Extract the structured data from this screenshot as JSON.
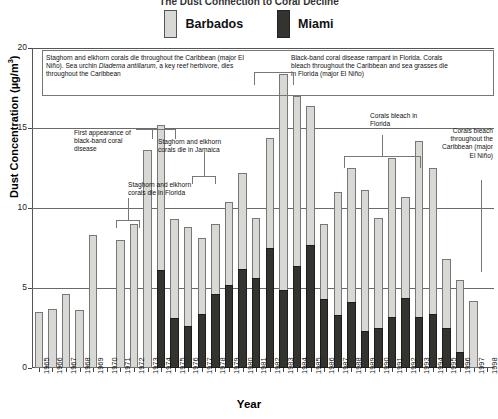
{
  "title": "The Dust Connection to Coral Decline",
  "legend": [
    {
      "label": "Barbados",
      "color": "#d8d8d4",
      "key": "barbados"
    },
    {
      "label": "Miami",
      "color": "#333330",
      "key": "miami"
    }
  ],
  "axes": {
    "y_title": "Dust Concentration (µg/m",
    "y_title_sup": "3",
    "y_title_close": ")",
    "x_title": "Year",
    "y_ticks": [
      "0",
      "5",
      "10",
      "15",
      "20"
    ]
  },
  "annotations": [
    {
      "id": "ann-1983-elnino",
      "text": "Staghorn and elkhorn corals die throughout the Caribbean (major El Niño). Sea urchin Diadema antillarum, a key reef herbivore, dies throughout the Caribbean"
    },
    {
      "id": "ann-blackband-rampant",
      "text": "Black-band coral disease rampant in Florida. Corals bleach throughout the Caribbean and sea grasses die in Florida (major El Niño)"
    },
    {
      "id": "ann-first-blackband",
      "text": "First appearance of black-band coral disease"
    },
    {
      "id": "ann-jamaica",
      "text": "Staghorn and elkhorn corals die in Jamaica"
    },
    {
      "id": "ann-florida-die",
      "text": "Staghorn and elkhorn corals die in Florida"
    },
    {
      "id": "ann-florida-bleach",
      "text": "Corals bleach in Florida"
    },
    {
      "id": "ann-1998-bleach",
      "text": "Corals bleach throughout the Caribbean (major El Niño)"
    }
  ],
  "chart_data": {
    "type": "bar",
    "title": "The Dust Connection to Coral Decline",
    "xlabel": "Year",
    "ylabel": "Dust Concentration (µg/m3)",
    "ylim": [
      0,
      20
    ],
    "yticks": [
      0,
      5,
      10,
      15,
      20
    ],
    "grid": true,
    "legend_position": "top-center",
    "categories": [
      "1965",
      "1966",
      "1967",
      "1968",
      "1969",
      "1970",
      "1971",
      "1972",
      "1973",
      "1974",
      "1975",
      "1976",
      "1977",
      "1978",
      "1979",
      "1980",
      "1981",
      "1982",
      "1983",
      "1984",
      "1985",
      "1986",
      "1987",
      "1988",
      "1989",
      "1990",
      "1991",
      "1992",
      "1993",
      "1994",
      "1995",
      "1996",
      "1997",
      "1998"
    ],
    "series": [
      {
        "name": "Barbados",
        "color": "#d8d8d4",
        "values": [
          3.5,
          3.7,
          4.6,
          3.6,
          8.3,
          null,
          8.0,
          9.0,
          13.6,
          15.2,
          9.3,
          8.8,
          8.1,
          9.0,
          10.4,
          12.2,
          9.4,
          14.4,
          18.4,
          17.0,
          16.4,
          9.0,
          11.0,
          12.5,
          11.1,
          9.4,
          13.1,
          10.7,
          14.2,
          12.5,
          6.8,
          5.5,
          4.2,
          null
        ]
      },
      {
        "name": "Miami",
        "color": "#333330",
        "values": [
          null,
          null,
          null,
          null,
          null,
          null,
          null,
          null,
          null,
          6.1,
          3.1,
          2.6,
          3.4,
          4.6,
          5.2,
          6.2,
          5.6,
          7.5,
          4.9,
          6.4,
          7.7,
          4.3,
          3.3,
          4.1,
          2.3,
          2.5,
          3.2,
          4.4,
          3.2,
          3.4,
          2.5,
          1.0,
          null,
          null
        ]
      }
    ],
    "notes": [
      "Staghorn and elkhorn corals die throughout the Caribbean (major El Niño). Sea urchin Diadema antillarum, a key reef herbivore, dies throughout the Caribbean",
      "Black-band coral disease rampant in Florida. Corals bleach throughout the Caribbean and sea grasses die in Florida (major El Niño)",
      "First appearance of black-band coral disease",
      "Staghorn and elkhorn corals die in Jamaica",
      "Staghorn and elkhorn corals die in Florida",
      "Corals bleach in Florida",
      "Corals bleach throughout the Caribbean (major El Niño)"
    ]
  }
}
